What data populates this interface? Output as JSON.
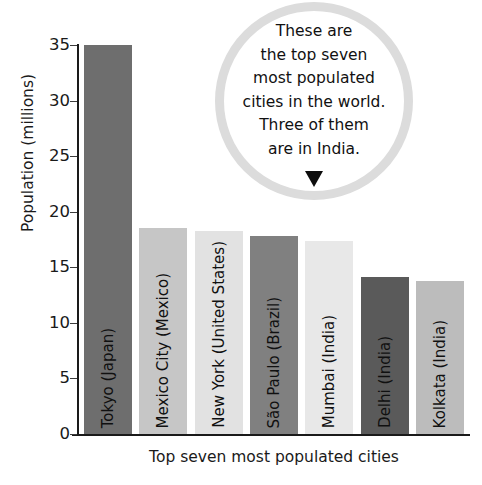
{
  "chart_data": {
    "type": "bar",
    "title": "",
    "xlabel": "Top seven most populated cities",
    "ylabel": "Population (millions)",
    "ylim": [
      0,
      35
    ],
    "ytick_labels": [
      "35",
      "30",
      "25",
      "20",
      "15",
      "10",
      "5",
      "0"
    ],
    "yticks": [
      35,
      30,
      25,
      20,
      15,
      10,
      5,
      0
    ],
    "grid": false,
    "legend": "none",
    "categories": [
      "Tokyo (Japan)",
      "Mexico City (Mexico)",
      "New York (United States)",
      "São Paulo (Brazil)",
      "Mumbai (India)",
      "Delhi (India)",
      "Kolkata (India)"
    ],
    "values": [
      35.0,
      18.5,
      18.3,
      17.8,
      17.4,
      14.1,
      13.8
    ],
    "bar_colors": [
      "#6e6e6e",
      "#c6c6c6",
      "#e2e2e2",
      "#808080",
      "#e8e8e8",
      "#5a5a5a",
      "#bcbcbc"
    ]
  },
  "callout": {
    "line1": "These are",
    "line2": "the top seven",
    "line3": "most populated",
    "line4": "cities in the world.",
    "line5": "Three of them",
    "line6": "are in India.",
    "ring_color": "#dcdcdc",
    "arrow_color": "#0d0d0d"
  },
  "axis": {
    "line_color": "#1a1a1a"
  }
}
